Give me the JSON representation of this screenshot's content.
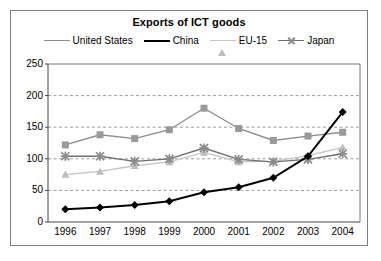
{
  "sliver": {
    "text": "··························"
  },
  "chart_data": {
    "type": "line",
    "title": "Exports of ICT goods",
    "xlabel": "",
    "ylabel": "",
    "categories": [
      "1996",
      "1997",
      "1998",
      "1999",
      "2000",
      "2001",
      "2002",
      "2003",
      "2004"
    ],
    "x": [
      1996,
      1997,
      1998,
      1999,
      2000,
      2001,
      2002,
      2003,
      2004
    ],
    "ylim": [
      0,
      250
    ],
    "yticks": [
      0,
      50,
      100,
      150,
      200,
      250
    ],
    "ytick_labels": [
      "0",
      "50",
      "100",
      "150",
      "200",
      "250"
    ],
    "grid": "horizontal-dashed",
    "legend_position": "top",
    "series": [
      {
        "name": "United States",
        "marker": "square",
        "color": "#9a9a9a",
        "line_color": "#8c8c8c",
        "values": [
          122,
          138,
          132,
          146,
          180,
          148,
          129,
          136,
          142
        ]
      },
      {
        "name": "China",
        "marker": "diamond",
        "color": "#000000",
        "line_color": "#000000",
        "values": [
          20,
          23,
          27,
          33,
          47,
          55,
          70,
          104,
          174
        ]
      },
      {
        "name": "EU-15",
        "marker": "triangle",
        "color": "#bdbdbd",
        "line_color": "#c4c4c4",
        "values": [
          75,
          80,
          89,
          95,
          110,
          95,
          96,
          105,
          118
        ]
      },
      {
        "name": "Japan",
        "marker": "x",
        "color": "#8a8a8a",
        "line_color": "#6f6f6f",
        "values": [
          104,
          104,
          96,
          100,
          117,
          99,
          95,
          99,
          108
        ]
      }
    ]
  }
}
